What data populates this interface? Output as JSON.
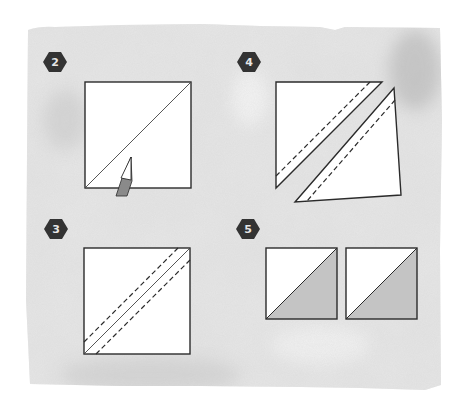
{
  "diagram": {
    "type": "quilting-instructions",
    "colors": {
      "background": "#ffffff",
      "paper_wash": "#dcdcdc",
      "paper_wash_dark": "#b8b8b8",
      "line": "#2b2b2b",
      "badge": "#333333",
      "badge_text": "#e6e6e6",
      "shaded_fabric": "#c4c4c4",
      "pencil_body": "#8a8a8a"
    },
    "steps": [
      {
        "number": "2",
        "caption": "Draw a diagonal line corner to corner on the wrong side of the light square",
        "elements": [
          "square",
          "diagonal-line",
          "pencil"
        ]
      },
      {
        "number": "3",
        "caption": "Sew a seam 1/4 inch on each side of the drawn line",
        "elements": [
          "square",
          "diagonal-line",
          "dashed-seam-upper",
          "dashed-seam-lower"
        ]
      },
      {
        "number": "4",
        "caption": "Cut on the drawn line to separate two triangle units",
        "elements": [
          "upper-triangle",
          "lower-triangle",
          "dashed-seams"
        ]
      },
      {
        "number": "5",
        "caption": "Press open to yield two half-square triangle units",
        "elements": [
          "hst-unit-1",
          "hst-unit-2"
        ]
      }
    ]
  }
}
